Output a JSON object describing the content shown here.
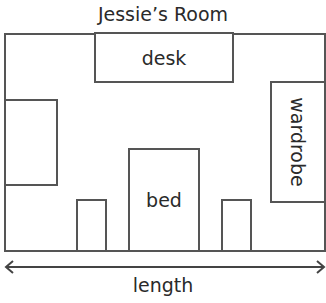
{
  "title": "Jessie’s Room",
  "furniture": {
    "desk": "desk",
    "wardrobe": "wardrobe",
    "bed": "bed"
  },
  "dimension": {
    "label": "length"
  }
}
